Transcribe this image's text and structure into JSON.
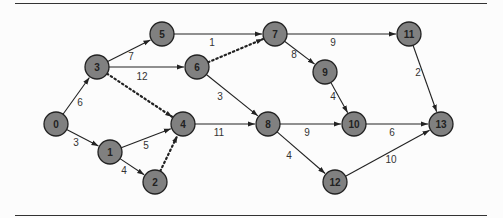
{
  "diagram": {
    "type": "network-graph",
    "colors": {
      "node_fill": "#808080",
      "node_stroke": "#222222",
      "edge": "#222222",
      "rule": "#333333"
    },
    "nodes": [
      {
        "id": "0",
        "label": "0",
        "x": 56,
        "y": 124
      },
      {
        "id": "1",
        "label": "1",
        "x": 110,
        "y": 152
      },
      {
        "id": "2",
        "label": "2",
        "x": 155,
        "y": 182
      },
      {
        "id": "3",
        "label": "3",
        "x": 97,
        "y": 67
      },
      {
        "id": "4",
        "label": "4",
        "x": 183,
        "y": 124
      },
      {
        "id": "5",
        "label": "5",
        "x": 162,
        "y": 34
      },
      {
        "id": "6",
        "label": "6",
        "x": 197,
        "y": 67
      },
      {
        "id": "7",
        "label": "7",
        "x": 275,
        "y": 34
      },
      {
        "id": "8",
        "label": "8",
        "x": 268,
        "y": 124
      },
      {
        "id": "9",
        "label": "9",
        "x": 325,
        "y": 72
      },
      {
        "id": "10",
        "label": "10",
        "x": 354,
        "y": 124
      },
      {
        "id": "11",
        "label": "11",
        "x": 409,
        "y": 34
      },
      {
        "id": "12",
        "label": "12",
        "x": 335,
        "y": 182
      },
      {
        "id": "13",
        "label": "13",
        "x": 441,
        "y": 124
      }
    ],
    "edges": [
      {
        "from": "0",
        "to": "3",
        "weight": "6",
        "dashed": false,
        "lx": 80,
        "ly": 106
      },
      {
        "from": "0",
        "to": "1",
        "weight": "3",
        "dashed": false,
        "lx": 76,
        "ly": 146
      },
      {
        "from": "1",
        "to": "4",
        "weight": "5",
        "dashed": false,
        "lx": 146,
        "ly": 149
      },
      {
        "from": "1",
        "to": "2",
        "weight": "4",
        "dashed": false,
        "lx": 124,
        "ly": 174
      },
      {
        "from": "2",
        "to": "4",
        "weight": "",
        "dashed": true,
        "lx": 0,
        "ly": 0
      },
      {
        "from": "3",
        "to": "5",
        "weight": "7",
        "dashed": false,
        "lx": 131,
        "ly": 60
      },
      {
        "from": "3",
        "to": "6",
        "weight": "12",
        "dashed": false,
        "lx": 142,
        "ly": 80
      },
      {
        "from": "3",
        "to": "4",
        "weight": "",
        "dashed": true,
        "lx": 0,
        "ly": 0
      },
      {
        "from": "4",
        "to": "8",
        "weight": "11",
        "dashed": false,
        "lx": 219,
        "ly": 136
      },
      {
        "from": "5",
        "to": "7",
        "weight": "1",
        "dashed": false,
        "lx": 212,
        "ly": 46
      },
      {
        "from": "6",
        "to": "7",
        "weight": "",
        "dashed": true,
        "lx": 0,
        "ly": 0
      },
      {
        "from": "6",
        "to": "8",
        "weight": "3",
        "dashed": false,
        "lx": 220,
        "ly": 100
      },
      {
        "from": "7",
        "to": "11",
        "weight": "9",
        "dashed": false,
        "lx": 333,
        "ly": 46
      },
      {
        "from": "7",
        "to": "9",
        "weight": "8",
        "dashed": false,
        "lx": 294,
        "ly": 58
      },
      {
        "from": "9",
        "to": "10",
        "weight": "4",
        "dashed": false,
        "lx": 333,
        "ly": 100
      },
      {
        "from": "8",
        "to": "10",
        "weight": "9",
        "dashed": false,
        "lx": 307,
        "ly": 136
      },
      {
        "from": "8",
        "to": "12",
        "weight": "4",
        "dashed": false,
        "lx": 289,
        "ly": 159
      },
      {
        "from": "10",
        "to": "13",
        "weight": "6",
        "dashed": false,
        "lx": 392,
        "ly": 136
      },
      {
        "from": "12",
        "to": "13",
        "weight": "10",
        "dashed": false,
        "lx": 391,
        "ly": 163
      },
      {
        "from": "11",
        "to": "13",
        "weight": "2",
        "dashed": false,
        "lx": 418,
        "ly": 76
      }
    ]
  }
}
